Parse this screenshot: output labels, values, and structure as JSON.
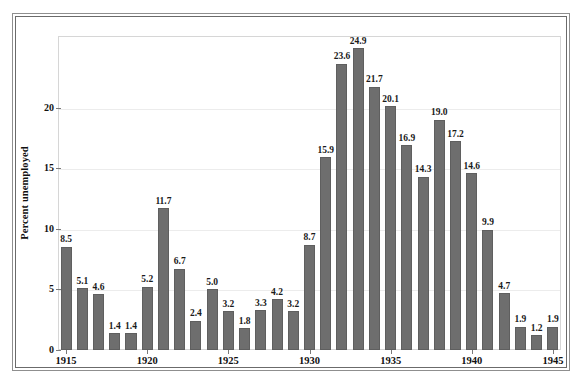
{
  "chart_data": {
    "type": "bar",
    "title": "",
    "xlabel": "",
    "ylabel": "Percent unemployed",
    "ylim": [
      0,
      25.9
    ],
    "yticks": [
      0,
      5,
      10,
      15,
      20
    ],
    "xtick_labels": [
      "1915",
      "1920",
      "1925",
      "1930",
      "1935",
      "1940",
      "1945"
    ],
    "grid": true,
    "legend": "none",
    "bar_color": "#6e6e6e",
    "categories": [
      "1915",
      "1916",
      "1917",
      "1918",
      "1919",
      "1920",
      "1921",
      "1922",
      "1923",
      "1924",
      "1925",
      "1926",
      "1927",
      "1928",
      "1929",
      "1930",
      "1931",
      "1932",
      "1933",
      "1934",
      "1935",
      "1936",
      "1937",
      "1938",
      "1939",
      "1940",
      "1941",
      "1942",
      "1943",
      "1944",
      "1945"
    ],
    "values": [
      8.5,
      5.1,
      4.6,
      1.4,
      1.4,
      5.2,
      11.7,
      6.7,
      2.4,
      5.0,
      3.2,
      1.8,
      3.3,
      4.2,
      3.2,
      8.7,
      15.9,
      23.6,
      24.9,
      21.7,
      20.1,
      16.9,
      14.3,
      19.0,
      17.2,
      14.6,
      9.9,
      4.7,
      1.9,
      1.2,
      1.9
    ],
    "data_labels": [
      "8.5",
      "5.1",
      "4.6",
      "1.4",
      "1.4",
      "5.2",
      "11.7",
      "6.7",
      "2.4",
      "5.0",
      "3.2",
      "1.8",
      "3.3",
      "4.2",
      "3.2",
      "8.7",
      "15.9",
      "23.6",
      "24.9",
      "21.7",
      "20.1",
      "16.9",
      "14.3",
      "19.0",
      "17.2",
      "14.6",
      "9.9",
      "4.7",
      "1.9",
      "1.2",
      "1.9"
    ]
  }
}
